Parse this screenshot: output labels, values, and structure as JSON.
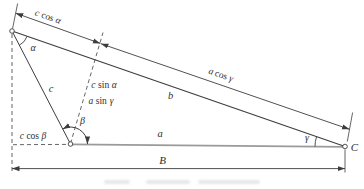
{
  "figure": {
    "type": "geometry-triangle-projection-diagram",
    "colors": {
      "background": "#ffffff",
      "line": "#3d3d3d",
      "side_a_gray": "#9a9a9a",
      "text": "#2e2e2e"
    },
    "labels": {
      "c_cos_alpha": {
        "pre": "c",
        "fn": "cos",
        "post": "α"
      },
      "a_cos_gamma": {
        "pre": "a",
        "fn": "cos",
        "post": "γ"
      },
      "c_sin_alpha": {
        "pre": "c",
        "fn": "sin",
        "post": "α"
      },
      "a_sin_gamma": {
        "pre": "a",
        "fn": "sin",
        "post": "γ"
      },
      "c_cos_beta": {
        "pre": "c",
        "fn": "cos",
        "post": "β"
      },
      "side_a": "a",
      "side_b": "b",
      "side_c": "c",
      "angle_alpha": "α",
      "angle_beta": "β",
      "angle_gamma": "γ",
      "baseline": "B",
      "vertex_c": "C"
    }
  }
}
